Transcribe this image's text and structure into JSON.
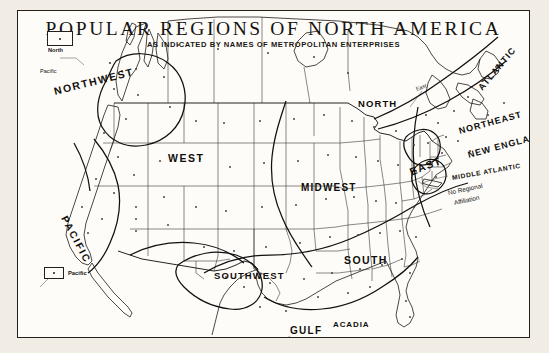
{
  "figure": {
    "title": "POPULAR REGIONS OF NORTH AMERICA",
    "subtitle": "AS INDICATED BY NAMES OF METROPOLITAN ENTERPRISES",
    "ink_color": "#15130f",
    "paper_color": "#fdfcf9",
    "margin_color": "#efeae1"
  },
  "region_labels": [
    {
      "name": "northwest",
      "text": "NORTHWEST",
      "x": 36,
      "y": 74,
      "size": 10.5,
      "rotate": -14,
      "spacing": 1.6
    },
    {
      "name": "pacific",
      "text": "PACIFIC",
      "x": 46,
      "y": 200,
      "size": 10,
      "rotate": 62,
      "spacing": 1.8
    },
    {
      "name": "west",
      "text": "WEST",
      "x": 150,
      "y": 141,
      "size": 10.5,
      "rotate": 0,
      "spacing": 1.5
    },
    {
      "name": "southwest",
      "text": "SOUTHWEST",
      "x": 196,
      "y": 259,
      "size": 9.5,
      "rotate": 0,
      "spacing": 1.1
    },
    {
      "name": "midwest",
      "text": "MIDWEST",
      "x": 283,
      "y": 171,
      "size": 10,
      "rotate": 0,
      "spacing": 1.2
    },
    {
      "name": "north",
      "text": "NORTH",
      "x": 340,
      "y": 87,
      "size": 9.5,
      "rotate": 0,
      "spacing": 1.1
    },
    {
      "name": "south",
      "text": "SOUTH",
      "x": 326,
      "y": 243,
      "size": 10.5,
      "rotate": 0,
      "spacing": 1.4
    },
    {
      "name": "gulf",
      "text": "GULF",
      "x": 272,
      "y": 314,
      "size": 10,
      "rotate": 0,
      "spacing": 1.3
    },
    {
      "name": "acadia",
      "text": "ACADIA",
      "x": 315,
      "y": 309,
      "size": 8,
      "rotate": 0,
      "spacing": 0.9
    },
    {
      "name": "east",
      "text": "EAST",
      "x": 392,
      "y": 155,
      "size": 10.5,
      "rotate": -22,
      "spacing": 1.3
    },
    {
      "name": "atlantic",
      "text": "ATLANTIC",
      "x": 462,
      "y": 73,
      "size": 9,
      "rotate": -50,
      "spacing": 1.1
    },
    {
      "name": "northeast",
      "text": "NORTHEAST",
      "x": 441,
      "y": 115,
      "size": 9,
      "rotate": -15,
      "spacing": 1.0
    },
    {
      "name": "new-england",
      "text": "NEW ENGLAND",
      "x": 450,
      "y": 139,
      "size": 9,
      "rotate": -15,
      "spacing": 1.0
    },
    {
      "name": "middle-atlantic",
      "text": "MIDDLE ATLANTIC",
      "x": 434,
      "y": 163,
      "size": 6.6,
      "rotate": -10,
      "spacing": 0.7
    }
  ],
  "small_labels": [
    {
      "name": "east-small",
      "text": "East",
      "x": 398,
      "y": 75,
      "size": 5.4,
      "rotate": -20
    },
    {
      "name": "no-regional-affiliation-line1",
      "text": "No Regional",
      "x": 430,
      "y": 178,
      "size": 6.4,
      "rotate": -12
    },
    {
      "name": "no-regional-affiliation-line2",
      "text": "Affiliation",
      "x": 436,
      "y": 188,
      "size": 6.4,
      "rotate": -12
    },
    {
      "name": "pacific-callout-top",
      "text": "Pacific",
      "x": 22,
      "y": 57,
      "size": 5.6,
      "rotate": 0
    },
    {
      "name": "south-callout",
      "text": "South",
      "x": 276,
      "y": 330,
      "size": 5.8,
      "rotate": 0
    }
  ],
  "legend_boxes": [
    {
      "name": "north-legend",
      "label": "North",
      "x": 29,
      "y": 20,
      "w": 26,
      "h": 15
    },
    {
      "name": "pacific-legend",
      "label": "Pacific",
      "x": 26,
      "y": 256,
      "w": 20,
      "h": 12
    }
  ],
  "map_data": {
    "type": "reference-map",
    "subject": "North America popular regions",
    "features": [
      "national-and-state-boundaries",
      "region-boundary-curves",
      "metropolitan-enterprise-dots"
    ]
  }
}
